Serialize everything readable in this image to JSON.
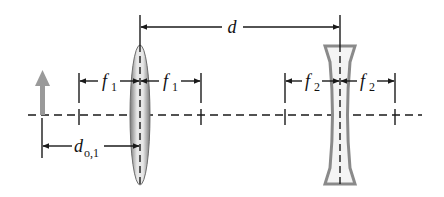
{
  "diagram": {
    "type": "two-lens optical system",
    "colors": {
      "line": "#1a1a1a",
      "lens": "#8a8a8a",
      "object_arrow": "#9a9a9a",
      "background": "#ffffff"
    },
    "object": {
      "icon": "upward-arrow-icon",
      "label": "object"
    },
    "lens1": {
      "kind": "converging",
      "focal_label": "f",
      "focal_sub": "1"
    },
    "lens2": {
      "kind": "diverging",
      "focal_label": "f",
      "focal_sub": "2"
    },
    "labels": {
      "separation": "d",
      "f1_left": {
        "main": "f",
        "sub": "1"
      },
      "f1_right": {
        "main": "f",
        "sub": "1"
      },
      "f2_left": {
        "main": "f",
        "sub": "2"
      },
      "f2_right": {
        "main": "f",
        "sub": "2"
      },
      "object_distance": {
        "main": "d",
        "sub": "o,1"
      }
    }
  }
}
